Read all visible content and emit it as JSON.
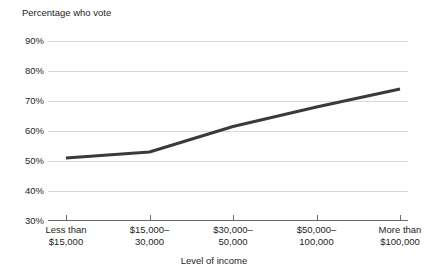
{
  "chart_data": {
    "type": "line",
    "title": "",
    "ylabel": "Percentage who vote",
    "xlabel": "Level of income",
    "categories": [
      "Less than $15,000",
      "$15,000–30,000",
      "$30,000–50,000",
      "$50,000–100,000",
      "More than $100,000"
    ],
    "category_lines": [
      [
        "Less than",
        "$15,000"
      ],
      [
        "$15,000–",
        "30,000"
      ],
      [
        "$30,000–",
        "50,000"
      ],
      [
        "$50,000–",
        "100,000"
      ],
      [
        "More than",
        "$100,000"
      ]
    ],
    "values": [
      51,
      53,
      61.5,
      68,
      74
    ],
    "series": [
      {
        "name": "Percentage who vote",
        "values": [
          51,
          53,
          61.5,
          68,
          74
        ],
        "color": "#3a3a3a"
      }
    ],
    "ylim": [
      30,
      90
    ],
    "ytick_values": [
      90,
      80,
      70,
      60,
      50,
      40,
      30
    ],
    "ytick_labels": [
      "90%",
      "80%",
      "70%",
      "60%",
      "50%",
      "40%",
      "30%"
    ],
    "grid": true,
    "legend": "none",
    "gridline_color": "#d8d8d8",
    "axis_color": "#6a6a6a",
    "line_color": "#3a3a3a",
    "text_color": "#231f20",
    "background": "#ffffff"
  }
}
